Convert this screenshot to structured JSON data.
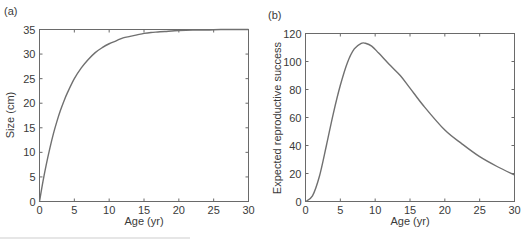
{
  "chart_data": [
    {
      "type": "line",
      "panel_label": "(a)",
      "title": "",
      "xlabel": "Age (yr)",
      "ylabel": "Size (cm)",
      "xlim": [
        0,
        30
      ],
      "ylim": [
        0,
        35
      ],
      "xticks": [
        0,
        5,
        10,
        15,
        20,
        25,
        30
      ],
      "yticks": [
        0,
        5,
        10,
        15,
        20,
        25,
        30,
        35
      ],
      "grid": false,
      "legend": "none",
      "series": [
        {
          "name": "size",
          "x": [
            0,
            0.5,
            1,
            1.5,
            2,
            2.5,
            3,
            3.5,
            4,
            5,
            6,
            7,
            8,
            9,
            10,
            11,
            12,
            13,
            14,
            15,
            16,
            17,
            18,
            20,
            22,
            24,
            26,
            28,
            30
          ],
          "y": [
            0,
            4.1,
            7.7,
            10.9,
            13.8,
            16.3,
            18.5,
            20.4,
            22.1,
            25.0,
            27.2,
            28.9,
            30.3,
            31.3,
            32.1,
            32.7,
            33.3,
            33.6,
            33.9,
            34.2,
            34.4,
            34.5,
            34.6,
            34.8,
            34.9,
            34.9,
            35.0,
            35.0,
            35.0
          ]
        }
      ]
    },
    {
      "type": "line",
      "panel_label": "(b)",
      "title": "",
      "xlabel": "Age (yr)",
      "ylabel": "Expected reproductive success",
      "xlim": [
        0,
        30
      ],
      "ylim": [
        0,
        120
      ],
      "xticks": [
        0,
        5,
        10,
        15,
        20,
        25,
        30
      ],
      "yticks": [
        0,
        20,
        40,
        60,
        80,
        100,
        120
      ],
      "grid": false,
      "legend": "none",
      "series": [
        {
          "name": "expected reproductive success",
          "x": [
            0,
            1,
            2,
            3,
            4,
            5,
            6,
            7,
            8,
            8.6,
            9.5,
            10.5,
            12,
            13.6,
            15,
            17,
            20,
            22.5,
            25,
            27.5,
            30
          ],
          "y": [
            0,
            4,
            18,
            40,
            63,
            83,
            99,
            109,
            113,
            113,
            111,
            106,
            98,
            90,
            81,
            68,
            51,
            41,
            32,
            25,
            19
          ]
        }
      ]
    }
  ],
  "caption": {
    "text": ""
  }
}
